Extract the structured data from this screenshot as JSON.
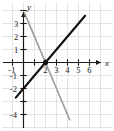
{
  "chart_data": {
    "type": "line",
    "title": "",
    "xlabel": "x",
    "ylabel": "y",
    "xlim": [
      -1.6,
      7.2
    ],
    "ylim": [
      -5.2,
      4.6
    ],
    "grid": true,
    "legend": false,
    "grid_color": "#d8d8d8",
    "axis_color": "#1a1a1a",
    "x_ticks": [
      2,
      3,
      4,
      5,
      6
    ],
    "x_tick_labels": [
      "2",
      "3",
      "4",
      "5",
      "6"
    ],
    "x_tick_all": [
      -1,
      1,
      2,
      3,
      4,
      5,
      6
    ],
    "y_ticks": [
      3,
      2,
      1,
      -1,
      -2,
      -4
    ],
    "y_tick_labels": [
      "3",
      "2",
      "1",
      "-1",
      "-2",
      "-4"
    ],
    "y_tick_all": [
      4,
      3,
      2,
      1,
      -1,
      -2,
      -3,
      -4
    ],
    "series": [
      {
        "name": "line-1",
        "color": "#101010",
        "width": 2.1,
        "slope": 1,
        "intercept": -2,
        "points": [
          [
            -0.7,
            -2.7
          ],
          [
            0,
            -2
          ],
          [
            2,
            0
          ],
          [
            5.6,
            3.6
          ]
        ]
      },
      {
        "name": "line-2",
        "color": "#9a9a9a",
        "width": 1.6,
        "slope": -2,
        "intercept": 4,
        "points": [
          [
            0.1,
            3.8
          ],
          [
            2,
            0
          ],
          [
            4.2,
            -4.4
          ]
        ]
      }
    ],
    "annotations": [
      {
        "name": "intersection-point",
        "kind": "point",
        "x": 2,
        "y": 0,
        "label": "",
        "color": "#101010",
        "radius": 2.6
      }
    ],
    "arrows": [
      "x-positive",
      "y-positive"
    ]
  },
  "labels": {
    "x_axis": "x",
    "y_axis": "y"
  }
}
